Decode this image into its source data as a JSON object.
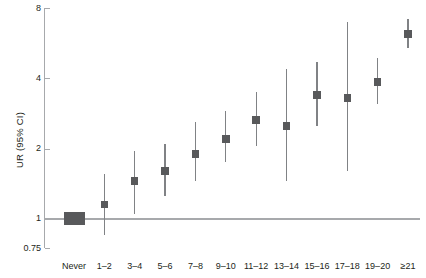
{
  "chart_data": {
    "type": "scatter",
    "title": "",
    "subtitle": "",
    "xlabel": "",
    "ylabel": "UR (95% CI)",
    "scale": "log",
    "grid": false,
    "legend": null,
    "ylim": [
      0.75,
      8
    ],
    "ytick_labels": [
      "8",
      "4",
      "2",
      "1",
      "0.75"
    ],
    "ytick_values": [
      8,
      4,
      2,
      1,
      0.75
    ],
    "reference_line": 1,
    "categories": [
      "Never",
      "1–2",
      "3–4",
      "5–6",
      "7–8",
      "9–10",
      "11–12",
      "13–14",
      "15–16",
      "17–18",
      "19–20",
      "≥21"
    ],
    "values": [
      1.0,
      1.15,
      1.45,
      1.6,
      1.9,
      2.2,
      2.65,
      2.5,
      3.4,
      3.3,
      3.85,
      6.2
    ],
    "ci_low": [
      null,
      0.85,
      1.05,
      1.25,
      1.45,
      1.75,
      2.05,
      1.45,
      2.5,
      1.6,
      3.1,
      5.4
    ],
    "ci_high": [
      null,
      1.55,
      1.95,
      2.1,
      2.6,
      2.9,
      3.5,
      4.4,
      4.7,
      7.0,
      4.9,
      7.2
    ],
    "reference_category": "Never",
    "marker_color": "#58595b",
    "ci_color": "#808285",
    "axis_color": "#a7a9ac",
    "text_color": "#231f20",
    "background_color": "#ffffff"
  }
}
